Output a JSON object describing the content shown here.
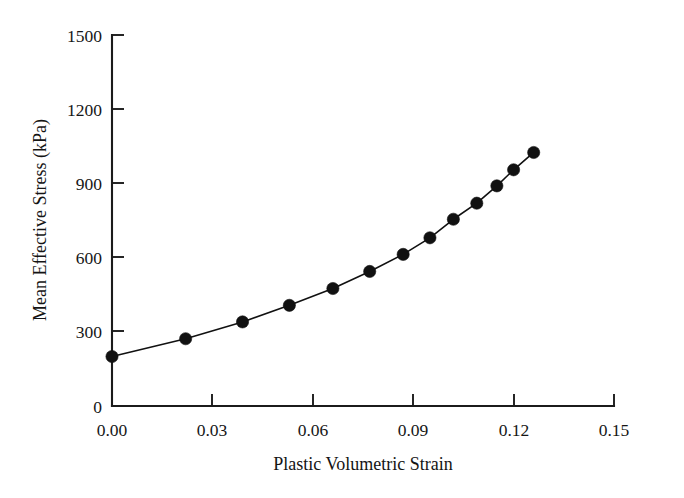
{
  "chart_data": {
    "type": "line",
    "title": "",
    "subtitle": "",
    "xlabel": "Plastic Volumetric Strain",
    "ylabel": "Mean Effective Stress (kPa)",
    "xlim": [
      0.0,
      0.15
    ],
    "ylim": [
      0,
      1500
    ],
    "xticks": [
      0.0,
      0.03,
      0.06,
      0.09,
      0.12,
      0.15
    ],
    "xticklabels": [
      "0.00",
      "0.03",
      "0.06",
      "0.09",
      "0.12",
      "0.15"
    ],
    "yticks": [
      0,
      300,
      600,
      900,
      1200,
      1500
    ],
    "yticklabels": [
      "0",
      "300",
      "600",
      "900",
      "1200",
      "1500"
    ],
    "grid": false,
    "legend": null,
    "legend_position": "none",
    "marker": "filled-circle",
    "marker_color": "#111111",
    "line_color": "#111111",
    "series": [
      {
        "name": "Mean Effective Stress",
        "x": [
          0.0,
          0.022,
          0.039,
          0.053,
          0.066,
          0.077,
          0.087,
          0.095,
          0.102,
          0.109,
          0.115,
          0.12,
          0.126
        ],
        "values": [
          200,
          272,
          340,
          407,
          475,
          544,
          613,
          680,
          755,
          820,
          890,
          955,
          1025
        ]
      }
    ]
  },
  "axes": {
    "x_axis_label": "Plastic Volumetric Strain",
    "y_axis_label": "Mean Effective Stress (kPa)"
  }
}
